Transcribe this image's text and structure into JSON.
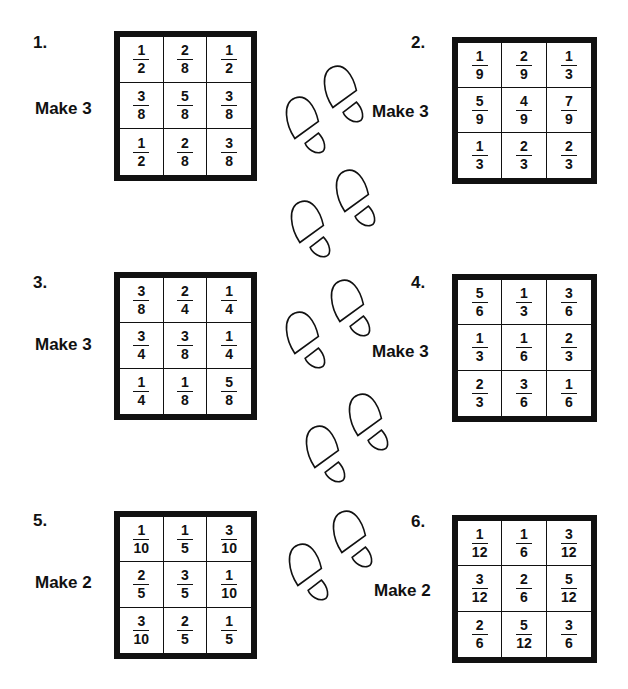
{
  "problems": [
    {
      "number": "1.",
      "instruction": "Make 3",
      "cells": [
        [
          "1",
          "2"
        ],
        [
          "2",
          "8"
        ],
        [
          "1",
          "2"
        ],
        [
          "3",
          "8"
        ],
        [
          "5",
          "8"
        ],
        [
          "3",
          "8"
        ],
        [
          "1",
          "2"
        ],
        [
          "2",
          "8"
        ],
        [
          "3",
          "8"
        ]
      ]
    },
    {
      "number": "2.",
      "instruction": "Make 3",
      "cells": [
        [
          "1",
          "9"
        ],
        [
          "2",
          "9"
        ],
        [
          "1",
          "3"
        ],
        [
          "5",
          "9"
        ],
        [
          "4",
          "9"
        ],
        [
          "7",
          "9"
        ],
        [
          "1",
          "3"
        ],
        [
          "2",
          "3"
        ],
        [
          "2",
          "3"
        ]
      ]
    },
    {
      "number": "3.",
      "instruction": "Make 3",
      "cells": [
        [
          "3",
          "8"
        ],
        [
          "2",
          "4"
        ],
        [
          "1",
          "4"
        ],
        [
          "3",
          "4"
        ],
        [
          "3",
          "8"
        ],
        [
          "1",
          "4"
        ],
        [
          "1",
          "4"
        ],
        [
          "1",
          "8"
        ],
        [
          "5",
          "8"
        ]
      ]
    },
    {
      "number": "4.",
      "instruction": "Make 3",
      "cells": [
        [
          "5",
          "6"
        ],
        [
          "1",
          "3"
        ],
        [
          "3",
          "6"
        ],
        [
          "1",
          "3"
        ],
        [
          "1",
          "6"
        ],
        [
          "2",
          "3"
        ],
        [
          "2",
          "3"
        ],
        [
          "3",
          "6"
        ],
        [
          "1",
          "6"
        ]
      ]
    },
    {
      "number": "5.",
      "instruction": "Make 2",
      "cells": [
        [
          "1",
          "10"
        ],
        [
          "1",
          "5"
        ],
        [
          "3",
          "10"
        ],
        [
          "2",
          "5"
        ],
        [
          "3",
          "5"
        ],
        [
          "1",
          "10"
        ],
        [
          "3",
          "10"
        ],
        [
          "2",
          "5"
        ],
        [
          "1",
          "5"
        ]
      ]
    },
    {
      "number": "6.",
      "instruction": "Make 2",
      "cells": [
        [
          "1",
          "12"
        ],
        [
          "1",
          "6"
        ],
        [
          "3",
          "12"
        ],
        [
          "3",
          "12"
        ],
        [
          "2",
          "6"
        ],
        [
          "5",
          "12"
        ],
        [
          "2",
          "6"
        ],
        [
          "5",
          "12"
        ],
        [
          "3",
          "6"
        ]
      ]
    }
  ],
  "decorations": {
    "footprints_icon": "footprints-icon",
    "ink_color": "#111111"
  }
}
